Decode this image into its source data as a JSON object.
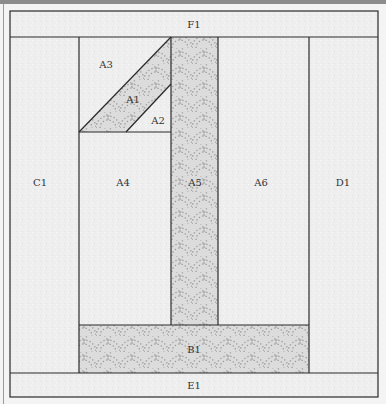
{
  "diagram": {
    "type": "quilt-block-piecing-diagram",
    "colors": {
      "background_fabric": "#eeeeee",
      "print_fabric": "#dcdcdc",
      "print_dots": "#9a9a9a",
      "seam_lines": "#2a2a2a",
      "top_bar": "#8c8c8c"
    },
    "pieces": {
      "F1": {
        "label": "F1",
        "fabric": "background"
      },
      "C1": {
        "label": "C1",
        "fabric": "background"
      },
      "A3": {
        "label": "A3",
        "fabric": "background"
      },
      "A1": {
        "label": "A1",
        "fabric": "print"
      },
      "A2": {
        "label": "A2",
        "fabric": "background"
      },
      "A4": {
        "label": "A4",
        "fabric": "background"
      },
      "A5": {
        "label": "A5",
        "fabric": "print"
      },
      "A6": {
        "label": "A6",
        "fabric": "background"
      },
      "D1": {
        "label": "D1",
        "fabric": "background"
      },
      "B1": {
        "label": "B1",
        "fabric": "print"
      },
      "E1": {
        "label": "E1",
        "fabric": "background"
      }
    }
  }
}
